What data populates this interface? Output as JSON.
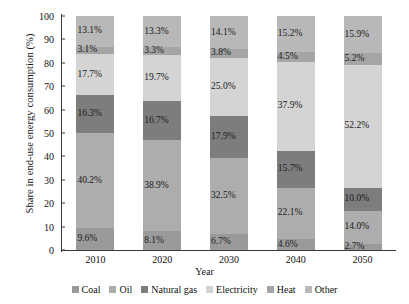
{
  "chart_data": {
    "type": "bar",
    "subtype": "stacked-bar-100",
    "title": "",
    "xlabel": "Year",
    "ylabel": "Share in end-use energy consumption (%)",
    "categories": [
      "2010",
      "2020",
      "2030",
      "2040",
      "2050"
    ],
    "ylim": [
      0,
      100
    ],
    "yticks": [
      "100",
      "90",
      "80",
      "70",
      "60",
      "50",
      "40",
      "30",
      "20",
      "10",
      "0"
    ],
    "ytick_values": [
      100,
      90,
      80,
      70,
      60,
      50,
      40,
      30,
      20,
      10,
      0
    ],
    "grid": false,
    "legend_position": "bottom",
    "stack_order_bottom_to_top": [
      "Coal",
      "Oil",
      "Natural gas",
      "Electricity",
      "Heat",
      "Other"
    ],
    "series": [
      {
        "name": "Coal",
        "color": "#9a9a9a",
        "values": [
          9.6,
          8.1,
          6.7,
          4.6,
          2.7
        ],
        "labels": [
          "9.6%",
          "8.1%",
          "6.7%",
          "4.6%",
          "2.7%"
        ]
      },
      {
        "name": "Oil",
        "color": "#adadad",
        "values": [
          40.2,
          38.9,
          32.5,
          22.1,
          14.0
        ],
        "labels": [
          "40.2%",
          "38.9%",
          "32.5%",
          "22.1%",
          "14.0%"
        ]
      },
      {
        "name": "Natural gas",
        "color": "#7d7d7d",
        "values": [
          16.3,
          16.7,
          17.9,
          15.7,
          10.0
        ],
        "labels": [
          "16.3%",
          "16.7%",
          "17.9%",
          "15.7%",
          "10.0%"
        ]
      },
      {
        "name": "Electricity",
        "color": "#d4d4d4",
        "values": [
          17.7,
          19.7,
          25.0,
          37.9,
          52.2
        ],
        "labels": [
          "17.7%",
          "19.7%",
          "25.0%",
          "37.9%",
          "52.2%"
        ]
      },
      {
        "name": "Heat",
        "color": "#a5a5a5",
        "values": [
          3.1,
          3.3,
          3.8,
          4.5,
          5.2
        ],
        "labels": [
          "3.1%",
          "3.3%",
          "3.8%",
          "4.5%",
          "5.2%"
        ]
      },
      {
        "name": "Other",
        "color": "#b8b8b8",
        "values": [
          13.1,
          13.3,
          14.1,
          15.2,
          15.9
        ],
        "labels": [
          "13.1%",
          "13.3%",
          "14.1%",
          "15.2%",
          "15.9%"
        ]
      }
    ],
    "legend": [
      {
        "label": "Coal",
        "color": "#9a9a9a"
      },
      {
        "label": "Oil",
        "color": "#adadad"
      },
      {
        "label": "Natural gas",
        "color": "#7d7d7d"
      },
      {
        "label": "Electricity",
        "color": "#d4d4d4"
      },
      {
        "label": "Heat",
        "color": "#a5a5a5"
      },
      {
        "label": "Other",
        "color": "#b8b8b8"
      }
    ]
  }
}
